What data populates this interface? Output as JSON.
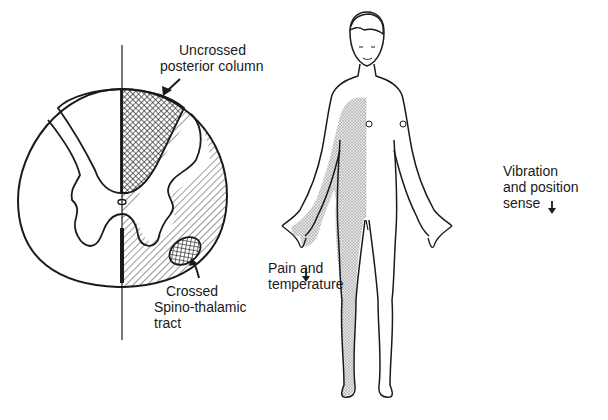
{
  "figure": {
    "spinal_cord": {
      "labels": {
        "posterior_column": [
          "Uncrossed",
          "posterior column"
        ],
        "spinothalamic": [
          "Crossed",
          "Spino-thalamic",
          "tract"
        ]
      }
    },
    "body": {
      "labels": {
        "pain_temp": [
          "Pain and",
          "temperature"
        ],
        "vibration": [
          "Vibration",
          "and position",
          "sense"
        ]
      },
      "arrow_symbol": "↓"
    },
    "colors": {
      "ink": "#1a1a1a",
      "background": "#ffffff",
      "shade": "#bdbdbd"
    }
  }
}
